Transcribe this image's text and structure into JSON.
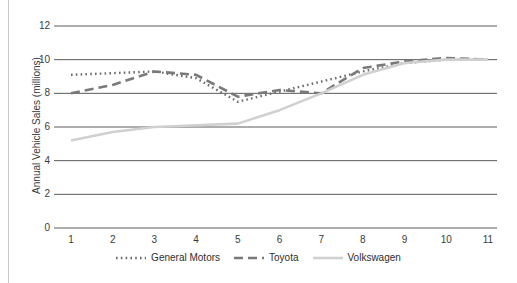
{
  "chart_data": {
    "type": "line",
    "title": "",
    "subtitle": "",
    "xlabel": "",
    "ylabel": "Annual Vehicle Sales (millions)",
    "categories": [
      "1",
      "2",
      "3",
      "4",
      "5",
      "6",
      "7",
      "8",
      "9",
      "10",
      "11"
    ],
    "x": [
      1,
      2,
      3,
      4,
      5,
      6,
      7,
      8,
      9,
      10,
      11
    ],
    "xlim": [
      1,
      11
    ],
    "ylim": [
      0,
      12
    ],
    "yticks": [
      "0",
      "2",
      "4",
      "6",
      "8",
      "10",
      "12"
    ],
    "ytick_values": [
      0,
      2,
      4,
      6,
      8,
      10,
      12
    ],
    "grid": "horizontal",
    "legend_position": "bottom",
    "series": [
      {
        "name": "General Motors",
        "values": [
          9.1,
          9.2,
          9.3,
          8.9,
          7.5,
          8.1,
          8.7,
          9.3,
          9.8,
          10.0,
          10.0
        ],
        "style": "dotted",
        "color": "#6d6d6d"
      },
      {
        "name": "Toyota",
        "values": [
          8.0,
          8.5,
          9.3,
          9.1,
          7.8,
          8.2,
          8.0,
          9.5,
          9.9,
          10.1,
          10.0
        ],
        "style": "dashed",
        "color": "#7a7a7a"
      },
      {
        "name": "Volkswagen",
        "values": [
          5.2,
          5.7,
          6.0,
          6.1,
          6.2,
          7.0,
          8.0,
          9.1,
          9.8,
          10.0,
          10.0
        ],
        "style": "solid",
        "color": "#d0d0d0"
      }
    ]
  },
  "axis": {
    "y_label": "Annual Vehicle Sales (millions)",
    "y_ticks": [
      "12",
      "10",
      "8",
      "6",
      "4",
      "2",
      "0"
    ],
    "x_ticks": [
      "1",
      "2",
      "3",
      "4",
      "5",
      "6",
      "7",
      "8",
      "9",
      "10",
      "11"
    ]
  },
  "legend": {
    "items": [
      {
        "label": "General Motors",
        "style": "dotted",
        "color": "#6d6d6d"
      },
      {
        "label": "Toyota",
        "style": "dashed",
        "color": "#7a7a7a"
      },
      {
        "label": "Volkswagen",
        "style": "solid",
        "color": "#d0d0d0"
      }
    ]
  },
  "colors": {
    "background": "#ffffff",
    "gridline": "#5a5a5a",
    "text": "#3b3b3b",
    "general_motors": "#6d6d6d",
    "toyota": "#7a7a7a",
    "volkswagen": "#d0d0d0"
  }
}
